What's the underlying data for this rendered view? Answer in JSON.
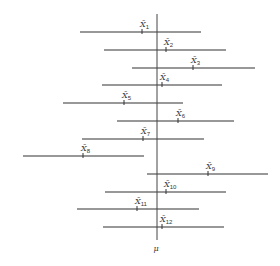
{
  "diagram": {
    "title": "",
    "axis": {
      "label": "μ",
      "x": 157,
      "y_top": 14,
      "y_bottom": 240,
      "color": "#444444"
    },
    "line_color": "#333333",
    "intervals": [
      {
        "label": "X̄",
        "sub": "1",
        "y": 32,
        "x1": 80,
        "x2": 201,
        "mean": 142
      },
      {
        "label": "X̄",
        "sub": "2",
        "y": 50,
        "x1": 104,
        "x2": 226,
        "mean": 166
      },
      {
        "label": "X̄",
        "sub": "3",
        "y": 68,
        "x1": 132,
        "x2": 255,
        "mean": 193
      },
      {
        "label": "X̄",
        "sub": "4",
        "y": 85,
        "x1": 102,
        "x2": 222,
        "mean": 162
      },
      {
        "label": "X̄",
        "sub": "5",
        "y": 103,
        "x1": 63,
        "x2": 183,
        "mean": 124
      },
      {
        "label": "X̄",
        "sub": "6",
        "y": 121,
        "x1": 117,
        "x2": 234,
        "mean": 178
      },
      {
        "label": "X̄",
        "sub": "7",
        "y": 139,
        "x1": 82,
        "x2": 204,
        "mean": 143
      },
      {
        "label": "X̄",
        "sub": "8",
        "y": 156,
        "x1": 23,
        "x2": 144,
        "mean": 83
      },
      {
        "label": "X̄",
        "sub": "9",
        "y": 174,
        "x1": 147,
        "x2": 268,
        "mean": 208
      },
      {
        "label": "X̄",
        "sub": "10",
        "y": 192,
        "x1": 105,
        "x2": 226,
        "mean": 166
      },
      {
        "label": "X̄",
        "sub": "11",
        "y": 209,
        "x1": 77,
        "x2": 199,
        "mean": 137
      },
      {
        "label": "X̄",
        "sub": "12",
        "y": 227,
        "x1": 103,
        "x2": 224,
        "mean": 162
      }
    ]
  }
}
